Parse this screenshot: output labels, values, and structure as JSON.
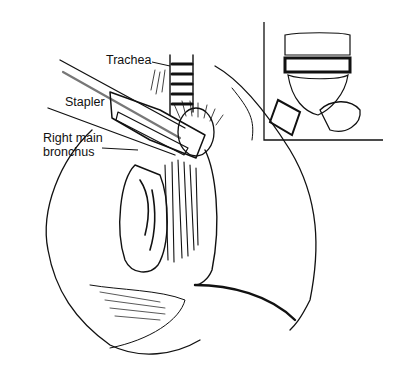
{
  "figure": {
    "labels": {
      "trachea": "Trachea",
      "stapler": "Stapler",
      "bronchus_line1": "Right main",
      "bronchus_line2": "bronchus"
    },
    "inset": {
      "description": "Stapled bronchial stump detail"
    },
    "colors": {
      "ink": "#111111",
      "background": "#ffffff"
    }
  }
}
